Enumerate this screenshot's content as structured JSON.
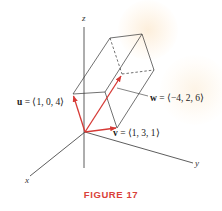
{
  "figure": {
    "caption": "FIGURE 17",
    "caption_color": "#d9413a",
    "vector_color": "#d63a36",
    "line_color": "#333333",
    "axes": {
      "x_label": "x",
      "y_label": "y",
      "z_label": "z"
    },
    "vectors": [
      {
        "name": "u",
        "label_bold": "u",
        "label_rest": " = ⟨1, 0, 4⟩",
        "components": [
          1,
          0,
          4
        ]
      },
      {
        "name": "v",
        "label_bold": "v",
        "label_rest": " = ⟨1, 3, 1⟩",
        "components": [
          1,
          3,
          1
        ]
      },
      {
        "name": "w",
        "label_bold": "w",
        "label_rest": " = ⟨−4, 2, 6⟩",
        "components": [
          -4,
          2,
          6
        ]
      }
    ],
    "shape": "parallelepiped spanned by u, v, w"
  }
}
